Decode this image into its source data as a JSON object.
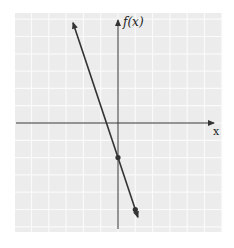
{
  "chart_data": {
    "type": "line",
    "title": "",
    "xlabel": "x",
    "ylabel": "f(x)",
    "xlim": [
      -6,
      6
    ],
    "ylim": [
      -6.3,
      6.3
    ],
    "grid": true,
    "tick_labels": false,
    "series": [
      {
        "name": "f(x) = -3x - 2",
        "slope": -3,
        "intercept": -2,
        "x": [
          -2.6,
          1.15
        ],
        "y": [
          5.8,
          -5.45
        ],
        "arrows_both_ends": true,
        "marked_points": [
          {
            "x": 0,
            "y": -2
          },
          {
            "x": 1,
            "y": -5
          }
        ]
      }
    ]
  },
  "labels": {
    "y_axis": "f(x)",
    "x_axis": "x"
  },
  "colors": {
    "grid_bg": "#ececec",
    "grid_line": "#fafafa",
    "axis": "#333333",
    "line": "#333333"
  }
}
